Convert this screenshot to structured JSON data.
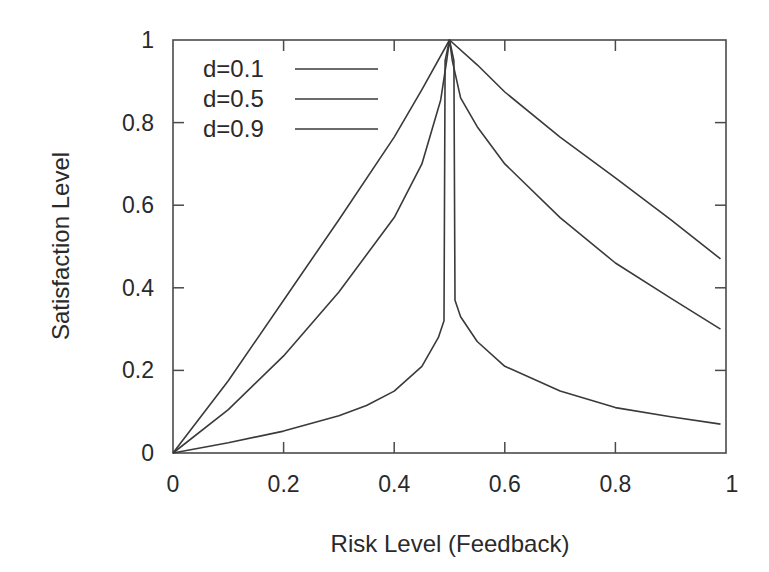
{
  "chart_data": {
    "type": "line",
    "title": "",
    "xlabel": "Risk Level (Feedback)",
    "ylabel": "Satisfaction Level",
    "xlim": [
      0,
      1
    ],
    "ylim": [
      0,
      1
    ],
    "xticks": [
      "0",
      "0.2",
      "0.4",
      "0.6",
      "0.8",
      "1"
    ],
    "yticks": [
      "0",
      "0.2",
      "0.4",
      "0.6",
      "0.8",
      "1"
    ],
    "grid": false,
    "legend_position": "upper-left",
    "line_color": "#3a3a3a",
    "series": [
      {
        "name": "d=0.1",
        "points": [
          [
            0,
            0
          ],
          [
            0.1,
            0.175
          ],
          [
            0.2,
            0.37
          ],
          [
            0.3,
            0.565
          ],
          [
            0.4,
            0.765
          ],
          [
            0.45,
            0.88
          ],
          [
            0.5,
            1.0
          ],
          [
            0.55,
            0.94
          ],
          [
            0.6,
            0.874
          ],
          [
            0.7,
            0.765
          ],
          [
            0.8,
            0.666
          ],
          [
            0.9,
            0.565
          ],
          [
            0.99,
            0.47
          ]
        ]
      },
      {
        "name": "d=0.5",
        "points": [
          [
            0,
            0
          ],
          [
            0.1,
            0.105
          ],
          [
            0.2,
            0.235
          ],
          [
            0.3,
            0.39
          ],
          [
            0.4,
            0.57
          ],
          [
            0.45,
            0.7
          ],
          [
            0.484,
            0.855
          ],
          [
            0.495,
            0.95
          ],
          [
            0.5,
            1.0
          ],
          [
            0.505,
            0.95
          ],
          [
            0.52,
            0.86
          ],
          [
            0.55,
            0.79
          ],
          [
            0.6,
            0.7
          ],
          [
            0.7,
            0.57
          ],
          [
            0.8,
            0.46
          ],
          [
            0.9,
            0.375
          ],
          [
            0.99,
            0.3
          ]
        ]
      },
      {
        "name": "d=0.9",
        "points": [
          [
            0,
            0
          ],
          [
            0.1,
            0.025
          ],
          [
            0.2,
            0.053
          ],
          [
            0.3,
            0.09
          ],
          [
            0.35,
            0.115
          ],
          [
            0.4,
            0.15
          ],
          [
            0.45,
            0.21
          ],
          [
            0.48,
            0.28
          ],
          [
            0.49,
            0.32
          ],
          [
            0.492,
            0.95
          ],
          [
            0.5,
            1.0
          ],
          [
            0.508,
            0.95
          ],
          [
            0.51,
            0.37
          ],
          [
            0.52,
            0.33
          ],
          [
            0.55,
            0.27
          ],
          [
            0.6,
            0.21
          ],
          [
            0.7,
            0.15
          ],
          [
            0.8,
            0.11
          ],
          [
            0.9,
            0.088
          ],
          [
            0.99,
            0.07
          ]
        ]
      }
    ]
  }
}
